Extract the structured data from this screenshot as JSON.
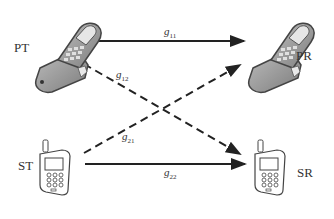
{
  "nodes": {
    "pt": {
      "label": "PT"
    },
    "pr": {
      "label": "PR"
    },
    "st": {
      "label": "ST"
    },
    "sr": {
      "label": "SR"
    }
  },
  "edges": {
    "g11": {
      "base": "g",
      "sub": "11",
      "style": "solid",
      "from": "PT",
      "to": "PR"
    },
    "g12": {
      "base": "g",
      "sub": "12",
      "style": "dashed",
      "from": "PT",
      "to": "SR"
    },
    "g21": {
      "base": "g",
      "sub": "21",
      "style": "dashed",
      "from": "ST",
      "to": "PR"
    },
    "g22": {
      "base": "g",
      "sub": "22",
      "style": "solid",
      "from": "ST",
      "to": "SR"
    }
  },
  "colors": {
    "line": "#222222",
    "phone_fill": "#9a9a9a",
    "phone_light": "#d8d8d8"
  }
}
